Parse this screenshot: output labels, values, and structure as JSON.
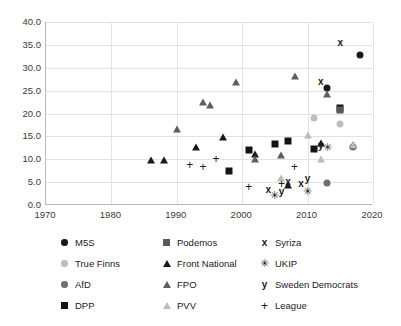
{
  "chart_data": {
    "type": "scatter",
    "title": "",
    "subtitle": "",
    "xlabel": "",
    "ylabel": "",
    "xlim": [
      1970,
      2020
    ],
    "ylim": [
      0.0,
      40.0
    ],
    "xticks": [
      "1970",
      "1980",
      "1990",
      "2000",
      "2010",
      "2020"
    ],
    "yticks": [
      "0.0",
      "5.0",
      "10.0",
      "15.0",
      "20.0",
      "25.0",
      "30.0",
      "35.0",
      "40.0"
    ],
    "grid": true,
    "legend_position": "bottom",
    "series": [
      {
        "name": "M5S",
        "marker": "circle",
        "color": "#1a1a1a",
        "points": [
          {
            "x": 2013,
            "y": 25.6
          },
          {
            "x": 2018,
            "y": 32.7
          }
        ]
      },
      {
        "name": "True Finns",
        "marker": "circle",
        "color": "#bdbdbd",
        "points": [
          {
            "x": 2011,
            "y": 19.1
          },
          {
            "x": 2015,
            "y": 17.7
          }
        ]
      },
      {
        "name": "AfD",
        "marker": "circle",
        "color": "#6e6e6e",
        "points": [
          {
            "x": 2013,
            "y": 4.7
          },
          {
            "x": 2017,
            "y": 12.6
          }
        ]
      },
      {
        "name": "DPP",
        "marker": "square",
        "color": "#141414",
        "points": [
          {
            "x": 1998,
            "y": 7.4
          },
          {
            "x": 2001,
            "y": 12.0
          },
          {
            "x": 2005,
            "y": 13.3
          },
          {
            "x": 2007,
            "y": 13.9
          },
          {
            "x": 2011,
            "y": 12.3
          },
          {
            "x": 2015,
            "y": 21.1
          }
        ]
      },
      {
        "name": "Podemos",
        "marker": "square",
        "color": "#5a5a5a",
        "points": [
          {
            "x": 2015,
            "y": 20.7
          }
        ]
      },
      {
        "name": "Front National",
        "marker": "triangle",
        "color": "#1a1a1a",
        "points": [
          {
            "x": 1986,
            "y": 9.8
          },
          {
            "x": 1988,
            "y": 9.8
          },
          {
            "x": 1993,
            "y": 12.7
          },
          {
            "x": 1997,
            "y": 14.9
          },
          {
            "x": 2002,
            "y": 11.1
          },
          {
            "x": 2007,
            "y": 4.3
          },
          {
            "x": 2012,
            "y": 13.6
          },
          {
            "x": 2017,
            "y": 13.2
          }
        ]
      },
      {
        "name": "FPO",
        "marker": "triangle",
        "color": "#5e5e5e",
        "points": [
          {
            "x": 1990,
            "y": 16.6
          },
          {
            "x": 1994,
            "y": 22.5
          },
          {
            "x": 1995,
            "y": 21.9
          },
          {
            "x": 1999,
            "y": 26.9
          },
          {
            "x": 2002,
            "y": 10.0
          },
          {
            "x": 2006,
            "y": 11.0
          },
          {
            "x": 2008,
            "y": 28.2
          },
          {
            "x": 2013,
            "y": 24.3
          }
        ]
      },
      {
        "name": "PVV",
        "marker": "triangle",
        "color": "#bcbcbc",
        "points": [
          {
            "x": 2006,
            "y": 5.9
          },
          {
            "x": 2010,
            "y": 15.4
          },
          {
            "x": 2012,
            "y": 10.0
          },
          {
            "x": 2017,
            "y": 13.1
          }
        ]
      },
      {
        "name": "Syriza",
        "marker": "x",
        "color": "#1a1a1a",
        "points": [
          {
            "x": 2004,
            "y": 3.3
          },
          {
            "x": 2007,
            "y": 5.0
          },
          {
            "x": 2009,
            "y": 4.6
          },
          {
            "x": 2012,
            "y": 26.9
          },
          {
            "x": 2015,
            "y": 35.5
          }
        ]
      },
      {
        "name": "UKIP",
        "marker": "star",
        "color": "#1a1a1a",
        "points": [
          {
            "x": 2005,
            "y": 2.2
          },
          {
            "x": 2010,
            "y": 3.1
          },
          {
            "x": 2013,
            "y": 12.6
          }
        ]
      },
      {
        "name": "Sweden Democrats",
        "marker": "y",
        "color": "#1a1a1a",
        "points": [
          {
            "x": 2006,
            "y": 2.9
          },
          {
            "x": 2010,
            "y": 5.7
          },
          {
            "x": 2012,
            "y": 12.9
          }
        ]
      },
      {
        "name": "League",
        "marker": "plus",
        "color": "#1a1a1a",
        "points": [
          {
            "x": 1992,
            "y": 8.7
          },
          {
            "x": 1994,
            "y": 8.4
          },
          {
            "x": 1996,
            "y": 10.1
          },
          {
            "x": 2001,
            "y": 3.9
          },
          {
            "x": 2006,
            "y": 4.6
          },
          {
            "x": 2008,
            "y": 8.3
          }
        ]
      }
    ]
  },
  "legend": {
    "columns": [
      {
        "entries": [
          {
            "label": "M5S",
            "marker": "circle",
            "color": "#1a1a1a"
          },
          {
            "label": "True Finns",
            "marker": "circle",
            "color": "#bdbdbd"
          },
          {
            "label": "AfD",
            "marker": "circle",
            "color": "#6e6e6e"
          },
          {
            "label": "DPP",
            "marker": "square",
            "color": "#141414"
          }
        ]
      },
      {
        "entries": [
          {
            "label": "Podemos",
            "marker": "square",
            "color": "#5a5a5a"
          },
          {
            "label": "Front National",
            "marker": "triangle",
            "color": "#1a1a1a"
          },
          {
            "label": "FPO",
            "marker": "triangle",
            "color": "#5e5e5e"
          },
          {
            "label": "PVV",
            "marker": "triangle",
            "color": "#bcbcbc"
          }
        ]
      },
      {
        "entries": [
          {
            "label": "Syriza",
            "marker": "x",
            "color": "#1a1a1a"
          },
          {
            "label": "UKIP",
            "marker": "star",
            "color": "#1a1a1a"
          },
          {
            "label": "Sweden Democrats",
            "marker": "y",
            "color": "#1a1a1a"
          },
          {
            "label": "League",
            "marker": "plus",
            "color": "#1a1a1a"
          }
        ]
      }
    ]
  },
  "glyphs": {
    "x": "x",
    "y": "y",
    "star": "✳",
    "plus": "+"
  }
}
